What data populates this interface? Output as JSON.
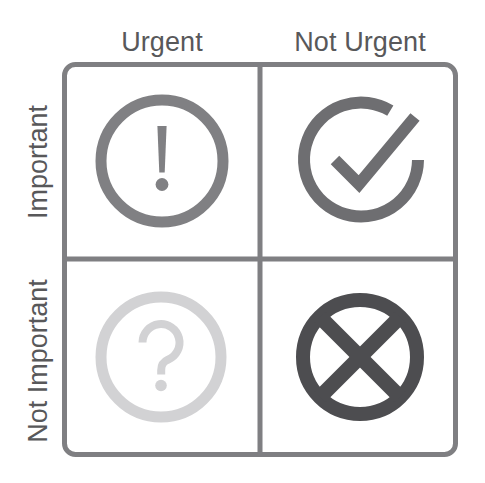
{
  "diagram": {
    "type": "eisenhower-matrix",
    "background_color": "#ffffff",
    "grid_line_color": "#7f7f82",
    "label_color": "#58585a"
  },
  "columns": [
    {
      "key": "urgent",
      "label": "Urgent"
    },
    {
      "key": "not_urgent",
      "label": "Not Urgent"
    }
  ],
  "rows": [
    {
      "key": "important",
      "label": "Important"
    },
    {
      "key": "not_important",
      "label": "Not Important"
    }
  ],
  "quadrants": [
    {
      "key": "important_urgent",
      "row": "Important",
      "column": "Urgent",
      "icon": "exclamation-circle-icon",
      "icon_color": "#808083"
    },
    {
      "key": "important_not_urgent",
      "row": "Important",
      "column": "Not Urgent",
      "icon": "check-circle-open-icon",
      "icon_color": "#6e6e71"
    },
    {
      "key": "not_important_urgent",
      "row": "Not Important",
      "column": "Urgent",
      "icon": "question-circle-icon",
      "icon_color": "#d2d2d4"
    },
    {
      "key": "not_important_not_urgent",
      "row": "Not Important",
      "column": "Not Urgent",
      "icon": "x-circle-icon",
      "icon_color": "#4d4d50"
    }
  ]
}
